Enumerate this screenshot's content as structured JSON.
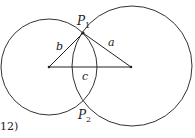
{
  "figure": {
    "number_label": "12)",
    "points": {
      "P1": {
        "label": "P",
        "sub": "1"
      },
      "P2": {
        "label": "P",
        "sub": "2"
      }
    },
    "sides": {
      "a": "a",
      "b": "b",
      "c": "c"
    },
    "colors": {
      "stroke": "#333333",
      "background": "#ffffff"
    }
  }
}
